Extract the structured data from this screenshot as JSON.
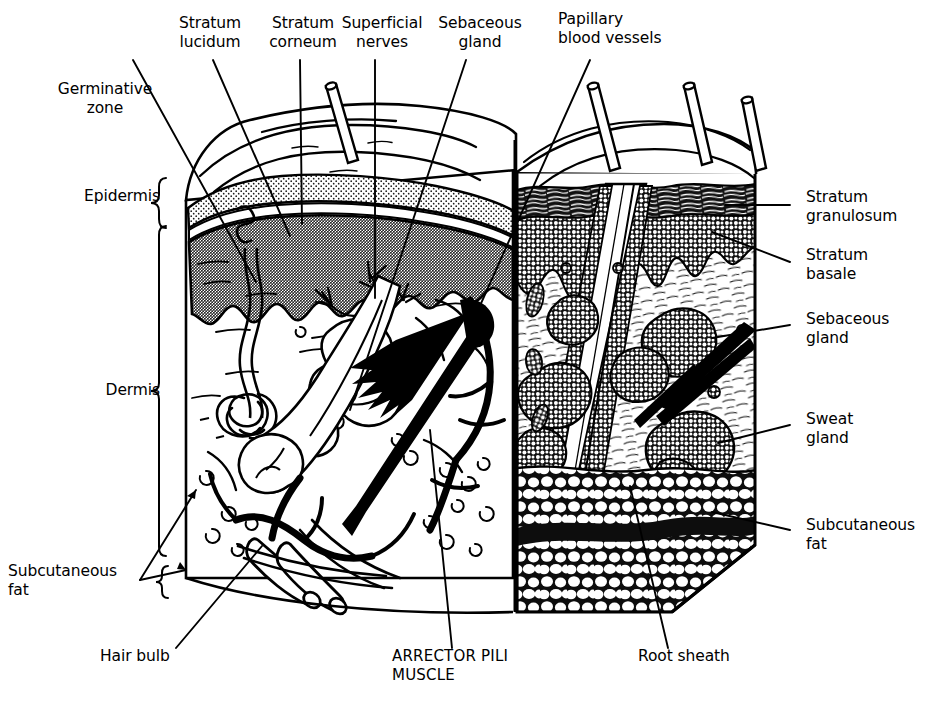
{
  "figure": {
    "kind": "anatomical-illustration",
    "background_color": "#ffffff",
    "ink_color": "#000000",
    "epidermis_band_color": "#9a9a9a",
    "stratum_corneum_stipple_color": "#7d7d7d"
  },
  "labels": {
    "germinative_zone": "Germinative\nzone",
    "stratum_lucidum": "Stratum\nlucidum",
    "stratum_corneum": "Stratum\ncorneum",
    "superficial_nerves": "Superficial\nnerves",
    "sebaceous_gland_top": "Sebaceous\ngland",
    "papillary_blood_vessels": "Papillary\nblood vessels",
    "epidermis": "Epidermis",
    "dermis": "Dermis",
    "subcutaneous_fat_left": "Subcutaneous\nfat",
    "stratum_granulosum": "Stratum\ngranulosum",
    "stratum_basale": "Stratum\nbasale",
    "sebaceous_gland_right": "Sebaceous\ngland",
    "sweat_gland": "Sweat\ngland",
    "subcutaneous_fat_right": "Subcutaneous\nfat",
    "hair_bulb": "Hair bulb",
    "arrector_pili_muscle": "ARRECTOR PILI\nMUSCLE",
    "root_sheath": "Root sheath"
  }
}
